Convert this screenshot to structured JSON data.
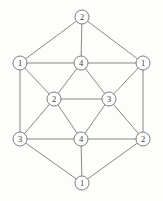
{
  "figure": {
    "type": "graph-diagram",
    "width": 163,
    "height": 201,
    "background_color": "#fdfdfc",
    "edge_color": "#7a7a78",
    "node_fill": "#ffffff",
    "node_stroke": "#6f6f6d",
    "label_color": "#3b3b3a",
    "node_radius": 7
  },
  "graph_data": {
    "type": "graph",
    "node_count": 12,
    "edge_count": 30,
    "label_meaning": "vertex color class",
    "color_classes": [
      "1",
      "2",
      "3",
      "4"
    ],
    "nodes": [
      {
        "id": "top",
        "label": "2",
        "x": 82,
        "y": 17
      },
      {
        "id": "upper-left",
        "label": "1",
        "x": 20,
        "y": 63
      },
      {
        "id": "inner-top",
        "label": "4",
        "x": 81,
        "y": 63
      },
      {
        "id": "upper-right",
        "label": "1",
        "x": 143,
        "y": 63
      },
      {
        "id": "inner-left",
        "label": "2",
        "x": 54,
        "y": 99
      },
      {
        "id": "inner-right",
        "label": "3",
        "x": 109,
        "y": 99
      },
      {
        "id": "lower-left",
        "label": "3",
        "x": 20,
        "y": 139
      },
      {
        "id": "inner-bottom",
        "label": "4",
        "x": 81,
        "y": 139
      },
      {
        "id": "lower-right",
        "label": "2",
        "x": 143,
        "y": 139
      },
      {
        "id": "bottom",
        "label": "1",
        "x": 82,
        "y": 183
      }
    ],
    "edges": [
      [
        "top",
        "upper-left"
      ],
      [
        "top",
        "upper-right"
      ],
      [
        "top",
        "inner-top"
      ],
      [
        "upper-left",
        "inner-top"
      ],
      [
        "upper-left",
        "inner-left"
      ],
      [
        "upper-left",
        "lower-left"
      ],
      [
        "upper-right",
        "inner-top"
      ],
      [
        "upper-right",
        "inner-right"
      ],
      [
        "upper-right",
        "lower-right"
      ],
      [
        "inner-top",
        "inner-left"
      ],
      [
        "inner-top",
        "inner-right"
      ],
      [
        "inner-left",
        "inner-right"
      ],
      [
        "inner-left",
        "lower-left"
      ],
      [
        "inner-left",
        "inner-bottom"
      ],
      [
        "inner-right",
        "inner-bottom"
      ],
      [
        "inner-right",
        "lower-right"
      ],
      [
        "lower-left",
        "inner-bottom"
      ],
      [
        "lower-left",
        "bottom"
      ],
      [
        "inner-bottom",
        "lower-right"
      ],
      [
        "inner-bottom",
        "bottom"
      ],
      [
        "lower-right",
        "bottom"
      ]
    ]
  }
}
